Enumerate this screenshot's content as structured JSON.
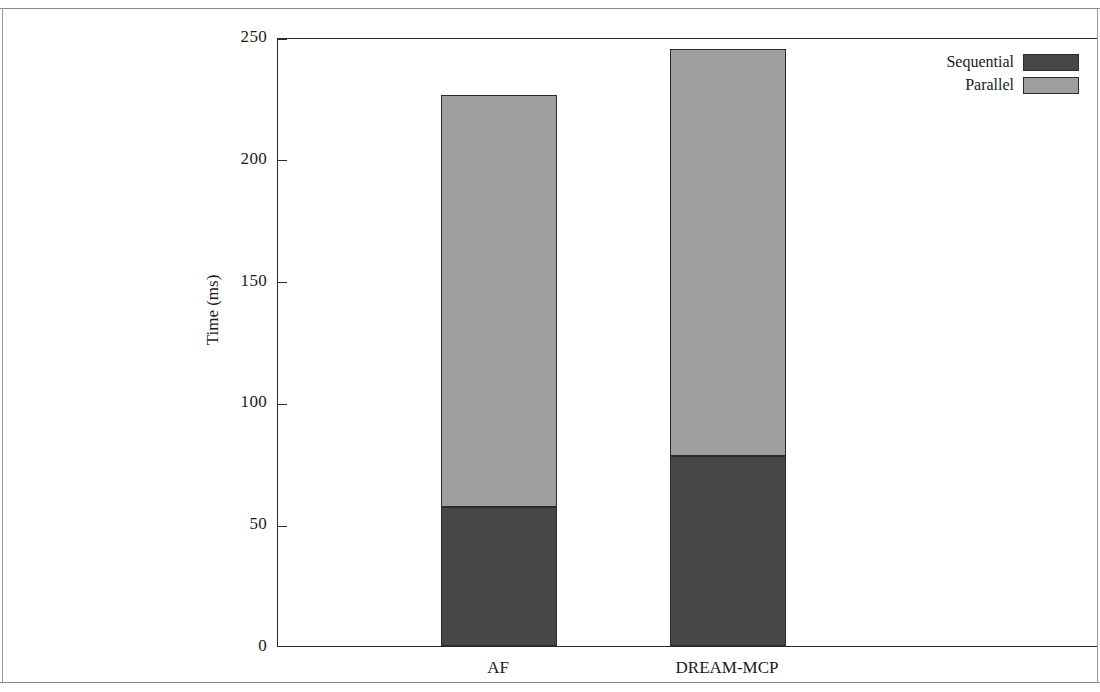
{
  "chart_data": {
    "type": "bar",
    "subtype": "stacked-vertical",
    "title": "",
    "xlabel": "",
    "ylabel": "Time (ms)",
    "ylim": [
      0,
      250
    ],
    "yticks": [
      0,
      50,
      100,
      150,
      200,
      250
    ],
    "ytick_labels": [
      "0",
      "50",
      "100",
      "150",
      "200",
      "250"
    ],
    "grid": false,
    "legend_position": "top-right",
    "categories": [
      "AF",
      "DREAM-MCP"
    ],
    "series": [
      {
        "name": "Sequential",
        "color": "#474747",
        "values": [
          57,
          78
        ]
      },
      {
        "name": "Parallel",
        "color": "#9e9e9e",
        "values": [
          169,
          167
        ]
      }
    ],
    "totals": [
      226,
      245
    ]
  },
  "axes": {
    "y_title": "Time (ms)",
    "y_ticks": [
      {
        "value": 250,
        "label": "250"
      },
      {
        "value": 200,
        "label": "200"
      },
      {
        "value": 150,
        "label": "150"
      },
      {
        "value": 100,
        "label": "100"
      },
      {
        "value": 50,
        "label": "50"
      },
      {
        "value": 0,
        "label": "0"
      }
    ],
    "x_ticks": [
      {
        "label": "AF"
      },
      {
        "label": "DREAM-MCP"
      }
    ]
  },
  "legend": {
    "items": [
      {
        "label": "Sequential",
        "color": "#474747"
      },
      {
        "label": "Parallel",
        "color": "#9e9e9e"
      }
    ]
  }
}
